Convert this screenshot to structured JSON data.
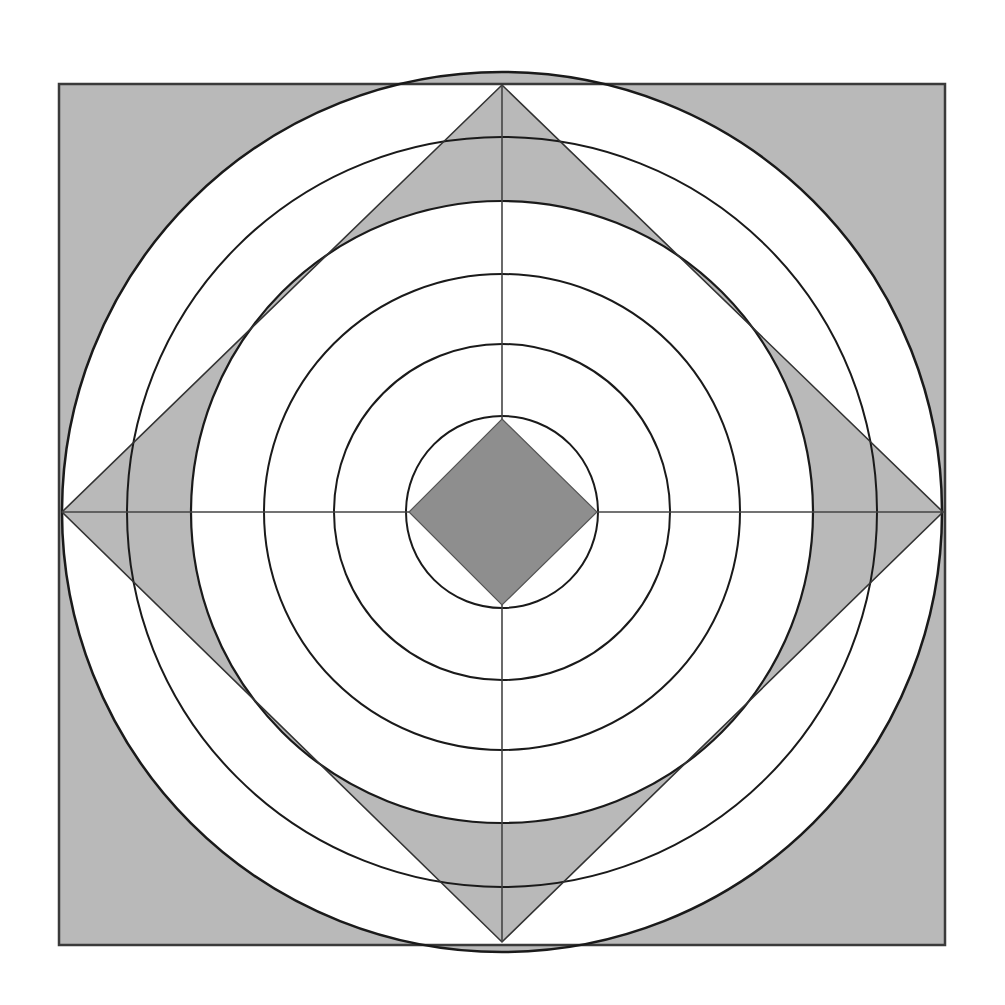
{
  "figure": {
    "title": "Concentric circles with inscribed diamonds",
    "background": "#ffffff",
    "colors": {
      "shade": "#b9b9b9",
      "dark_shade": "#8e8e8e",
      "stroke": "#1a1a1a",
      "frame_stroke": "#3a3a3a"
    },
    "center": [
      502,
      512
    ],
    "frame": {
      "x": 59,
      "y": 84,
      "width": 886,
      "height": 861
    },
    "outer_circle_radius": 440,
    "shaded_circle_radius": 311,
    "outline_circle_radii": [
      375,
      238,
      168,
      96
    ],
    "large_diamond": [
      [
        502,
        85
      ],
      [
        943,
        512
      ],
      [
        502,
        942
      ],
      [
        62,
        512
      ]
    ],
    "small_diamond": [
      [
        502,
        419
      ],
      [
        597,
        512
      ],
      [
        502,
        605
      ],
      [
        409,
        512
      ]
    ],
    "axes": {
      "horizontal": [
        [
          62,
          512
        ],
        [
          943,
          512
        ]
      ],
      "vertical": [
        [
          502,
          85
        ],
        [
          502,
          942
        ]
      ]
    }
  }
}
